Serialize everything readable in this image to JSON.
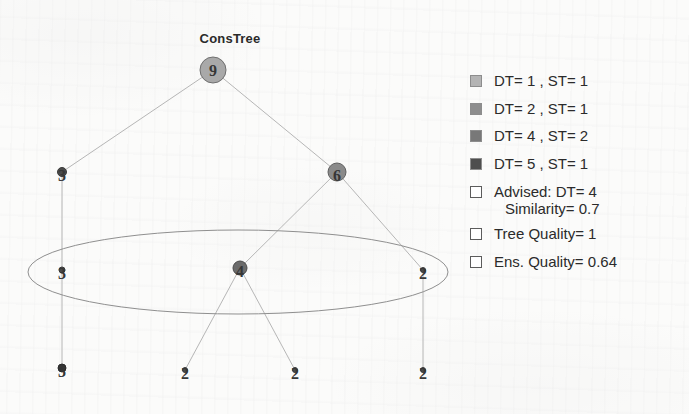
{
  "chart": {
    "title": "ConsTree",
    "type": "diagram-tree"
  },
  "chart_data": {
    "type": "tree",
    "title": "ConsTree",
    "nodes": [
      {
        "id": "n9",
        "label": "9",
        "x": 213,
        "y": 70,
        "r": 13,
        "fill": "#a9a9a9",
        "stroke": "#6f6f6f"
      },
      {
        "id": "n3a",
        "label": "3",
        "x": 62,
        "y": 172,
        "r": 4.5,
        "fill": "#4a4a4a",
        "stroke": "#3a3a3a"
      },
      {
        "id": "n6",
        "label": "6",
        "x": 337,
        "y": 172,
        "r": 9,
        "fill": "#8a8a8a",
        "stroke": "#5f5f5f"
      },
      {
        "id": "n3b",
        "label": "3",
        "x": 62,
        "y": 270,
        "r": 3,
        "fill": "#4a4a4a",
        "stroke": "#3a3a3a"
      },
      {
        "id": "n4",
        "label": "4",
        "x": 240,
        "y": 268,
        "r": 7,
        "fill": "#6b6b6b",
        "stroke": "#4a4a4a"
      },
      {
        "id": "n2a",
        "label": "2",
        "x": 423,
        "y": 270,
        "r": 2.5,
        "fill": "#4a4a4a",
        "stroke": "#3a3a3a"
      },
      {
        "id": "n3c",
        "label": "3",
        "x": 62,
        "y": 368,
        "r": 4,
        "fill": "#333333",
        "stroke": "#2a2a2a"
      },
      {
        "id": "n2b",
        "label": "2",
        "x": 185,
        "y": 370,
        "r": 2.5,
        "fill": "#4a4a4a",
        "stroke": "#3a3a3a"
      },
      {
        "id": "n2c",
        "label": "2",
        "x": 295,
        "y": 370,
        "r": 2.5,
        "fill": "#4a4a4a",
        "stroke": "#3a3a3a"
      },
      {
        "id": "n2d",
        "label": "2",
        "x": 423,
        "y": 370,
        "r": 2.5,
        "fill": "#4a4a4a",
        "stroke": "#3a3a3a"
      }
    ],
    "edges": [
      {
        "from": "n9",
        "to": "n3a"
      },
      {
        "from": "n9",
        "to": "n6"
      },
      {
        "from": "n3a",
        "to": "n3b"
      },
      {
        "from": "n3b",
        "to": "n3c"
      },
      {
        "from": "n6",
        "to": "n4"
      },
      {
        "from": "n6",
        "to": "n2a"
      },
      {
        "from": "n4",
        "to": "n2b"
      },
      {
        "from": "n4",
        "to": "n2c"
      },
      {
        "from": "n2a",
        "to": "n2d"
      }
    ],
    "highlight_ellipse": {
      "cx": 238,
      "cy": 272,
      "rx": 210,
      "ry": 42,
      "stroke": "#8f8f8f",
      "fill": "none"
    },
    "edge_color": "#b6b6b6",
    "background": "#fbfbfa"
  },
  "legend": {
    "items": [
      {
        "label": "DT= 1 , ST= 1",
        "swatch": "filled",
        "color": "#b4b4b4"
      },
      {
        "label": "DT= 2 , ST= 1",
        "swatch": "filled",
        "color": "#8e8e8e"
      },
      {
        "label": "DT= 4 , ST= 2",
        "swatch": "filled",
        "color": "#787878"
      },
      {
        "label": "DT= 5 , ST= 1",
        "swatch": "filled",
        "color": "#4e4e4e"
      },
      {
        "label": "Advised: DT= 4",
        "label2": "Similarity= 0.7",
        "swatch": "hollow",
        "color": "#ffffff"
      },
      {
        "label": "Tree Quality= 1",
        "swatch": "hollow",
        "color": "#ffffff"
      },
      {
        "label": "Ens. Quality= 0.64",
        "swatch": "hollow",
        "color": "#ffffff"
      }
    ]
  }
}
